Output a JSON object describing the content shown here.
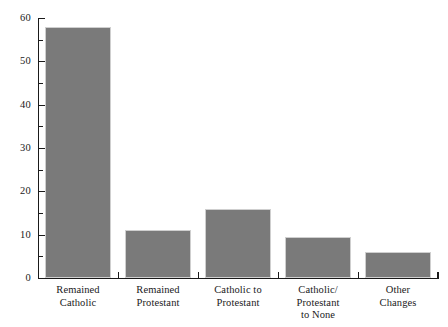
{
  "chart_data": {
    "type": "bar",
    "title": "",
    "subtitle": "",
    "xlabel": "",
    "ylabel": "",
    "ylim": [
      0,
      60
    ],
    "xlim": [
      0,
      5
    ],
    "grid": false,
    "legend": false,
    "bar_color": "#7a7a7a",
    "bar_outline_color": "#cfcfcf",
    "axis_color": "#1a1a1a",
    "background_color": "#ffffff",
    "y_major_step": 10,
    "y_minor_step": 5,
    "categories": [
      "Remained Catholic",
      "Remained Protestant",
      "Catholic to Protestant",
      "Catholic/Protestant to None",
      "Other Changes"
    ],
    "category_lines": [
      [
        "Remained",
        "Catholic"
      ],
      [
        "Remained",
        "Protestant"
      ],
      [
        "Catholic to",
        "Protestant"
      ],
      [
        "Catholic/",
        "Protestant",
        "to None"
      ],
      [
        "Other",
        "Changes"
      ]
    ],
    "values": [
      58,
      11,
      16,
      9.5,
      6
    ],
    "y_tick_labels": [
      "0",
      "10",
      "20",
      "30",
      "40",
      "50",
      "60"
    ],
    "y_tick_values": [
      0,
      10,
      20,
      30,
      40,
      50,
      60
    ],
    "y_minor_tick_values": [
      5,
      15,
      25,
      35,
      45,
      55
    ]
  }
}
